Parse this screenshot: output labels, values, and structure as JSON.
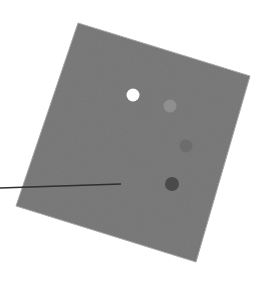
{
  "figure": {
    "canvas": {
      "width": 275,
      "height": 284,
      "background": "#ffffff"
    },
    "plate": {
      "name": "gray-square-plate",
      "shape": "rotated-square",
      "fill": "#b0b0b0",
      "edge_shade": "#a6a6a6",
      "rotation_deg": 16.8,
      "corners": [
        {
          "label": "top",
          "x": 78,
          "y": 23
        },
        {
          "label": "right",
          "x": 250,
          "y": 76
        },
        {
          "label": "bottom",
          "x": 196,
          "y": 262
        },
        {
          "label": "left",
          "x": 16,
          "y": 206
        }
      ]
    },
    "markers": [
      {
        "id": "marker-1",
        "label": "white dot",
        "x": 133,
        "y": 95,
        "r": 6.5,
        "color": "#fdfdfb"
      },
      {
        "id": "marker-2",
        "label": "light gray dot",
        "x": 170,
        "y": 106,
        "r": 6.5,
        "color": "#8f8f8f"
      },
      {
        "id": "marker-3",
        "label": "medium gray dot",
        "x": 186,
        "y": 146,
        "r": 6.5,
        "color": "#6d6d6d"
      },
      {
        "id": "marker-4",
        "label": "dark gray dot",
        "x": 172,
        "y": 184,
        "r": 7.0,
        "color": "#4a4a4a"
      }
    ],
    "leader_line": {
      "id": "pointer-line",
      "label": "leader line",
      "color": "#2e2e34",
      "width": 1.6,
      "x1": 0,
      "y1": 188,
      "x2": 121,
      "y2": 184
    }
  }
}
